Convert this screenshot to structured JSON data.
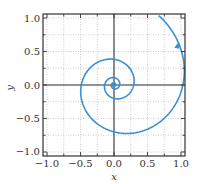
{
  "chart_data": {
    "type": "line",
    "title": "",
    "xlabel": "x",
    "ylabel": "y",
    "xlim": [
      -1.06,
      1.06
    ],
    "ylim": [
      -1.06,
      1.06
    ],
    "xticks": [
      -1.0,
      -0.5,
      0.0,
      0.5,
      1.0
    ],
    "yticks": [
      -1.0,
      -0.5,
      0.0,
      0.5,
      1.0
    ],
    "xtick_labels": [
      "−1.0",
      "−0.5",
      "0.0",
      "0.5",
      "1.0"
    ],
    "ytick_labels": [
      "−1.0",
      "−0.5",
      "0.0",
      "0.5",
      "1.0"
    ],
    "grid": true,
    "grid_style": "dotted",
    "minor_ticks": 0.25,
    "series": [
      {
        "name": "spiral trajectory",
        "color": "#3a8fd6",
        "description": "Clockwise inward spiral converging to origin (stable focus)",
        "key_points": [
          {
            "x": 0.55,
            "y": 1.06
          },
          {
            "x": 0.95,
            "y": 0.55
          },
          {
            "x": 0.97,
            "y": 0.0
          },
          {
            "x": 0.12,
            "y": -0.75
          },
          {
            "x": -0.52,
            "y": 0.0
          },
          {
            "x": 0.0,
            "y": 0.38
          },
          {
            "x": 0.28,
            "y": 0.0
          },
          {
            "x": 0.0,
            "y": -0.2
          },
          {
            "x": -0.14,
            "y": 0.0
          },
          {
            "x": 0.0,
            "y": 0.0
          }
        ],
        "arrow": {
          "x": 0.95,
          "y": 0.6,
          "direction": "clockwise-inward"
        }
      }
    ],
    "fixed_point": {
      "x": 0.0,
      "y": 0.0
    }
  }
}
